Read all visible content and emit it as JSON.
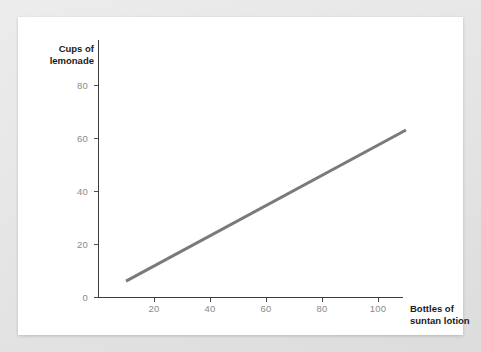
{
  "card": {
    "background_color": "#ffffff",
    "page_background_color": "#e8e8e8"
  },
  "chart_data": {
    "type": "line",
    "title": "",
    "xlabel": "Bottles of suntan lotion",
    "ylabel": "Cups of lemonade",
    "xlabel_lines": [
      "Bottles of",
      "suntan lotion"
    ],
    "ylabel_lines": [
      "Cups of",
      "lemonade"
    ],
    "series": [
      {
        "name": "lemonade vs suntan lotion",
        "color": "#7a7a7a",
        "line_width": 3,
        "x": [
          10,
          110
        ],
        "values": [
          6,
          63
        ]
      }
    ],
    "x": [
      10,
      110
    ],
    "xlim": [
      0,
      116
    ],
    "ylim": [
      0,
      97
    ],
    "xticks": [
      20,
      40,
      60,
      80,
      100
    ],
    "yticks": [
      0,
      20,
      40,
      60,
      80
    ],
    "xtick_labels": [
      "20",
      "40",
      "60",
      "80",
      "100"
    ],
    "ytick_labels": [
      "0",
      "20",
      "40",
      "60",
      "80"
    ],
    "grid": false,
    "legend": false,
    "legend_position": "none",
    "tick_label_color": "#8a8a8a",
    "axis_color": "#3d3d3d",
    "axis_title_color": "#1a1a1a",
    "annotation": "Positive linear association: cups of lemonade increase with bottles of suntan lotion"
  }
}
